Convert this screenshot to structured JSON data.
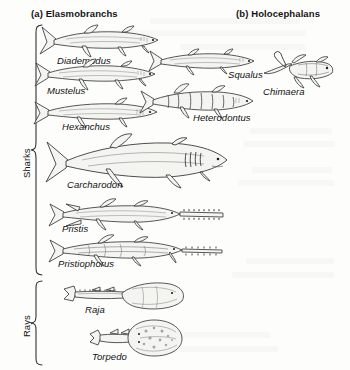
{
  "figure": {
    "kind": "cartilaginous-fish-taxonomy-plate",
    "background_color": "#fdfdfc",
    "ink_color": "#1b1b1b"
  },
  "headers": [
    {
      "id": "a",
      "label": "(a) Elasmobranchs",
      "x": 31,
      "y": 8
    },
    {
      "id": "b",
      "label": "(b) Holocephalans",
      "x": 236,
      "y": 8
    }
  ],
  "groups": [
    {
      "id": "sharks",
      "label": "Sharks",
      "bracket_top": 24,
      "bracket_bottom": 276,
      "label_x": 13,
      "label_y": 178
    },
    {
      "id": "rays",
      "label": "Rays",
      "bracket_top": 280,
      "bracket_bottom": 366,
      "label_x": 13,
      "label_y": 337
    }
  ],
  "taxa": [
    {
      "name": "Diademodus",
      "group": "sharks",
      "column": "a",
      "label_x": 57,
      "label_y": 61,
      "art_x": 38,
      "art_y": 22,
      "art_w": 128,
      "art_h": 40,
      "form": "shark"
    },
    {
      "name": "Mustelus",
      "group": "sharks",
      "column": "a",
      "label_x": 47,
      "label_y": 91,
      "art_x": 33,
      "art_y": 57,
      "art_w": 126,
      "art_h": 36,
      "form": "shark"
    },
    {
      "name": "Squalus",
      "group": "sharks",
      "column": "a",
      "label_x": 228,
      "label_y": 75,
      "art_x": 148,
      "art_y": 46,
      "art_w": 108,
      "art_h": 32,
      "form": "shark"
    },
    {
      "name": "Hexanchus",
      "group": "sharks",
      "column": "a",
      "label_x": 62,
      "label_y": 127,
      "art_x": 33,
      "art_y": 96,
      "art_w": 126,
      "art_h": 34,
      "form": "shark"
    },
    {
      "name": "Heterodontus",
      "group": "sharks",
      "column": "a",
      "label_x": 193,
      "label_y": 118,
      "art_x": 138,
      "art_y": 83,
      "art_w": 118,
      "art_h": 38,
      "form": "banded-shark"
    },
    {
      "name": "Carcharodon",
      "group": "sharks",
      "column": "a",
      "label_x": 67,
      "label_y": 185,
      "art_x": 44,
      "art_y": 136,
      "art_w": 186,
      "art_h": 54,
      "form": "great-white"
    },
    {
      "name": "Pristis",
      "group": "sharks",
      "column": "a",
      "label_x": 62,
      "label_y": 229,
      "art_x": 48,
      "art_y": 198,
      "art_w": 178,
      "art_h": 34,
      "form": "sawfish"
    },
    {
      "name": "Pristiophorus",
      "group": "sharks",
      "column": "a",
      "label_x": 58,
      "label_y": 264,
      "art_x": 48,
      "art_y": 233,
      "art_w": 178,
      "art_h": 34,
      "form": "sawshark"
    },
    {
      "name": "Raja",
      "group": "rays",
      "column": "a",
      "label_x": 85,
      "label_y": 310,
      "art_x": 62,
      "art_y": 281,
      "art_w": 124,
      "art_h": 32,
      "form": "skate"
    },
    {
      "name": "Torpedo",
      "group": "rays",
      "column": "a",
      "label_x": 92,
      "label_y": 357,
      "art_x": 88,
      "art_y": 318,
      "art_w": 98,
      "art_h": 40,
      "form": "electric-ray"
    },
    {
      "name": "Chimaera",
      "group": "holocephalans",
      "column": "b",
      "label_x": 263,
      "label_y": 92,
      "art_x": 262,
      "art_y": 52,
      "art_w": 74,
      "art_h": 38,
      "form": "chimaera"
    }
  ]
}
